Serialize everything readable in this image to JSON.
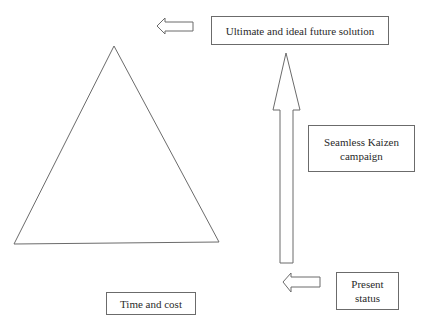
{
  "diagram": {
    "boxes": {
      "ultimate": "Ultimate and ideal future solution",
      "kaizen": "Seamless Kaizen campaign",
      "present": "Present status",
      "time_cost": "Time and cost"
    },
    "shapes": {
      "triangle": "triangle",
      "arrows": [
        "left-arrow-top",
        "up-arrow",
        "left-arrow-bottom"
      ]
    },
    "stroke_color": "#6b6b6b"
  }
}
